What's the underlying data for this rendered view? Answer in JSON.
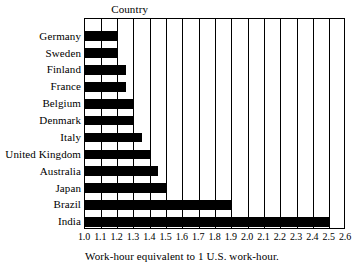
{
  "chart_data": {
    "type": "bar",
    "orientation": "horizontal",
    "title": "",
    "category_axis_header": "Country",
    "xlabel": "Work-hour equivalent to 1 U.S. work-hour.",
    "ylabel": "",
    "xlim": [
      1.0,
      2.6
    ],
    "xtick_step": 0.1,
    "xticks": [
      "1.0",
      "1.1",
      "1.2",
      "1.3",
      "1.4",
      "1.5",
      "1.6",
      "1.7",
      "1.8",
      "1.9",
      "2.0",
      "2.1",
      "2.2",
      "2.3",
      "2.4",
      "2.5",
      "2.6"
    ],
    "xtick_values": [
      1.0,
      1.1,
      1.2,
      1.3,
      1.4,
      1.5,
      1.6,
      1.7,
      1.8,
      1.9,
      2.0,
      2.1,
      2.2,
      2.3,
      2.4,
      2.5,
      2.6
    ],
    "grid": "vertical",
    "legend": "none",
    "bar_color": "#000000",
    "categories": [
      "Germany",
      "Sweden",
      "Finland",
      "France",
      "Belgium",
      "Denmark",
      "Italy",
      "United Kingdom",
      "Australia",
      "Japan",
      "Brazil",
      "India"
    ],
    "values": [
      1.2,
      1.2,
      1.25,
      1.25,
      1.3,
      1.3,
      1.35,
      1.4,
      1.45,
      1.5,
      1.9,
      2.5
    ],
    "series": [
      {
        "name": "Work-hour equivalent",
        "values": [
          1.2,
          1.2,
          1.25,
          1.25,
          1.3,
          1.3,
          1.35,
          1.4,
          1.45,
          1.5,
          1.9,
          2.5
        ]
      }
    ],
    "points": [
      {
        "category": "Germany",
        "value": 1.2
      },
      {
        "category": "Sweden",
        "value": 1.2
      },
      {
        "category": "Finland",
        "value": 1.25
      },
      {
        "category": "France",
        "value": 1.25
      },
      {
        "category": "Belgium",
        "value": 1.3
      },
      {
        "category": "Denmark",
        "value": 1.3
      },
      {
        "category": "Italy",
        "value": 1.35
      },
      {
        "category": "United Kingdom",
        "value": 1.4
      },
      {
        "category": "Australia",
        "value": 1.45
      },
      {
        "category": "Japan",
        "value": 1.5
      },
      {
        "category": "Brazil",
        "value": 1.9
      },
      {
        "category": "India",
        "value": 2.5
      }
    ]
  }
}
